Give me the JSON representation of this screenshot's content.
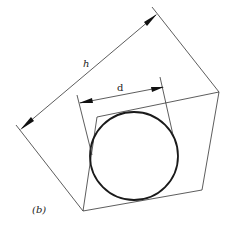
{
  "diagram": {
    "labels": {
      "h": "h",
      "d": "d",
      "panel": "(b)"
    },
    "colors": {
      "line": "#333333",
      "circle": "#1a1a1a",
      "background": "#ffffff"
    },
    "shapes": {
      "square": {
        "points": "97,117 219,92 202,190 83,211"
      },
      "circle": {
        "cx": 134,
        "cy": 156,
        "r": 44
      },
      "h_extension_left": {
        "x1": 16,
        "y1": 125,
        "x2": 83,
        "y2": 211
      },
      "h_extension_right": {
        "x1": 152,
        "y1": 7,
        "x2": 219,
        "y2": 92
      },
      "h_dimension": {
        "x1": 22,
        "y1": 128,
        "x2": 156,
        "y2": 15
      },
      "d_extension_left": {
        "x1": 77,
        "y1": 95,
        "x2": 92,
        "y2": 155
      },
      "d_extension_right": {
        "x1": 160,
        "y1": 77,
        "x2": 173,
        "y2": 135
      },
      "d_dimension": {
        "x1": 81,
        "y1": 103,
        "x2": 163,
        "y2": 87
      }
    }
  }
}
